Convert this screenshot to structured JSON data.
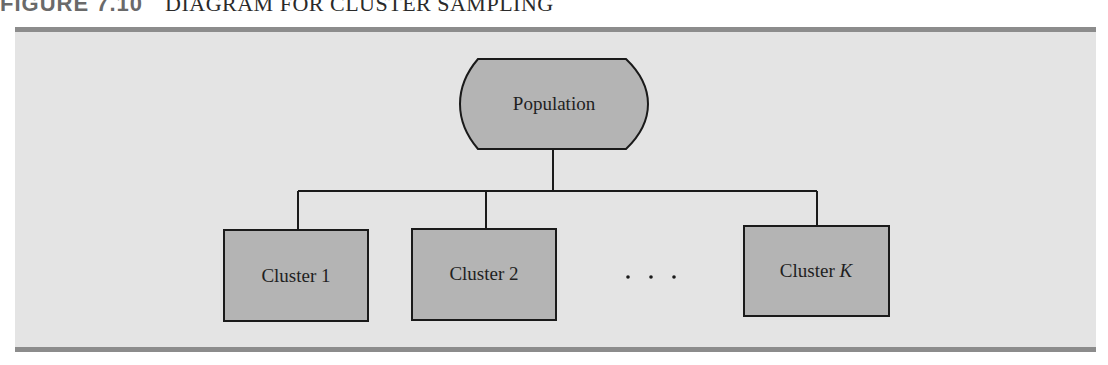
{
  "figure": {
    "number": "FIGURE 7.10",
    "title": "DIAGRAM FOR CLUSTER SAMPLING"
  },
  "diagram": {
    "root": {
      "label": "Population"
    },
    "clusters": [
      {
        "label": "Cluster 1"
      },
      {
        "label": "Cluster 2"
      },
      {
        "label_prefix": "Cluster ",
        "label_italic": "K"
      }
    ],
    "ellipsis": ". . ."
  },
  "colors": {
    "panel_background": "#e4e4e4",
    "rule": "#8c8c8c",
    "box_fill": "#b4b4b4",
    "stroke": "#1a1a1a"
  }
}
